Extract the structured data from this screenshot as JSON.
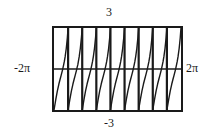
{
  "figure": {
    "kind": "graphing-calculator-plot",
    "background_color": "#ffffff",
    "ink_color": "#1a1a1a"
  },
  "labels": {
    "top": "3",
    "bottom": "-3",
    "left": "-2π",
    "right": "2π"
  },
  "frame": {
    "left_px": 52,
    "top_px": 26,
    "width_px": 131,
    "height_px": 86,
    "border_color": "#1a1a1a",
    "border_width": 2
  },
  "chart_data": {
    "type": "line",
    "title": "",
    "subtitle": "",
    "xlabel": "",
    "ylabel": "",
    "xlim": [
      -6.283185307179586,
      6.283185307179586
    ],
    "ylim": [
      -3,
      3
    ],
    "xlim_labels": [
      "-2π",
      "2π"
    ],
    "ylim_labels": [
      "-3",
      "3"
    ],
    "grid": false,
    "legend": null,
    "legend_position": "none",
    "axis_line_y": 0,
    "axis_line_color": "#1a1a1a",
    "function_description": "tangent-like periodic function with steep vertical asymptotes",
    "period": 1.3962634015954636,
    "branch_count": 9,
    "asymptotes": [
      -6.283185307179586,
      -4.886921905584123,
      -3.490658503988659,
      -2.0943951023931953,
      -0.6981317007977318,
      0.6981317007977318,
      2.0943951023931953,
      3.490658503988659,
      4.886921905584123,
      6.283185307179586
    ],
    "series": [
      {
        "name": "y = tan(4.5x)",
        "color": "#1a1a1a",
        "line_width": 1.4,
        "branches": [
          {
            "x": [
              -6.28,
              -6.1,
              -5.95,
              -5.8,
              -5.68,
              -5.59,
              -5.52,
              -5.45,
              -5.39,
              -5.33,
              -5.26,
              -5.18,
              -5.07,
              -4.96,
              -4.89
            ],
            "y": [
              -3.0,
              -2.2,
              -1.6,
              -1.1,
              -0.75,
              -0.5,
              -0.3,
              -0.1,
              0.1,
              0.3,
              0.55,
              0.9,
              1.5,
              2.3,
              3.0
            ]
          },
          {
            "x": [
              -4.89,
              -4.71,
              -4.56,
              -4.41,
              -4.29,
              -4.2,
              -4.13,
              -4.06,
              -4.0,
              -3.93,
              -3.87,
              -3.79,
              -3.68,
              -3.57,
              -3.49
            ],
            "y": [
              -3.0,
              -2.2,
              -1.6,
              -1.1,
              -0.75,
              -0.5,
              -0.3,
              -0.1,
              0.1,
              0.3,
              0.55,
              0.9,
              1.5,
              2.3,
              3.0
            ]
          },
          {
            "x": [
              -3.49,
              -3.31,
              -3.16,
              -3.01,
              -2.89,
              -2.8,
              -2.73,
              -2.66,
              -2.6,
              -2.54,
              -2.47,
              -2.39,
              -2.28,
              -2.17,
              -2.09
            ],
            "y": [
              -3.0,
              -2.2,
              -1.6,
              -1.1,
              -0.75,
              -0.5,
              -0.3,
              -0.1,
              0.1,
              0.3,
              0.55,
              0.9,
              1.5,
              2.3,
              3.0
            ]
          },
          {
            "x": [
              -2.09,
              -1.91,
              -1.76,
              -1.61,
              -1.49,
              -1.4,
              -1.33,
              -1.26,
              -1.2,
              -1.14,
              -1.07,
              -0.99,
              -0.88,
              -0.77,
              -0.7
            ],
            "y": [
              -3.0,
              -2.2,
              -1.6,
              -1.1,
              -0.75,
              -0.5,
              -0.3,
              -0.1,
              0.1,
              0.3,
              0.55,
              0.9,
              1.5,
              2.3,
              3.0
            ]
          },
          {
            "x": [
              -0.7,
              -0.52,
              -0.37,
              -0.22,
              -0.1,
              -0.01,
              0.06,
              0.13,
              0.19,
              0.25,
              0.32,
              0.4,
              0.51,
              0.62,
              0.7
            ],
            "y": [
              -3.0,
              -2.2,
              -1.6,
              -1.1,
              -0.75,
              -0.5,
              -0.3,
              -0.1,
              0.1,
              0.3,
              0.55,
              0.9,
              1.5,
              2.3,
              3.0
            ]
          },
          {
            "x": [
              0.7,
              0.88,
              1.03,
              1.18,
              1.3,
              1.39,
              1.46,
              1.53,
              1.59,
              1.65,
              1.72,
              1.8,
              1.91,
              2.02,
              2.09
            ],
            "y": [
              -3.0,
              -2.2,
              -1.6,
              -1.1,
              -0.75,
              -0.5,
              -0.3,
              -0.1,
              0.1,
              0.3,
              0.55,
              0.9,
              1.5,
              2.3,
              3.0
            ]
          },
          {
            "x": [
              2.09,
              2.27,
              2.42,
              2.57,
              2.69,
              2.78,
              2.85,
              2.92,
              2.98,
              3.04,
              3.11,
              3.19,
              3.3,
              3.41,
              3.49
            ],
            "y": [
              -3.0,
              -2.2,
              -1.6,
              -1.1,
              -0.75,
              -0.5,
              -0.3,
              -0.1,
              0.1,
              0.3,
              0.55,
              0.9,
              1.5,
              2.3,
              3.0
            ]
          },
          {
            "x": [
              3.49,
              3.67,
              3.82,
              3.97,
              4.09,
              4.18,
              4.25,
              4.32,
              4.38,
              4.44,
              4.51,
              4.59,
              4.7,
              4.81,
              4.89
            ],
            "y": [
              -3.0,
              -2.2,
              -1.6,
              -1.1,
              -0.75,
              -0.5,
              -0.3,
              -0.1,
              0.1,
              0.3,
              0.55,
              0.9,
              1.5,
              2.3,
              3.0
            ]
          },
          {
            "x": [
              4.89,
              5.07,
              5.22,
              5.37,
              5.49,
              5.58,
              5.65,
              5.72,
              5.78,
              5.84,
              5.91,
              5.99,
              6.1,
              6.21,
              6.28
            ],
            "y": [
              -3.0,
              -2.2,
              -1.6,
              -1.1,
              -0.75,
              -0.5,
              -0.3,
              -0.1,
              0.1,
              0.3,
              0.55,
              0.9,
              1.5,
              2.3,
              3.0
            ]
          }
        ]
      }
    ]
  }
}
